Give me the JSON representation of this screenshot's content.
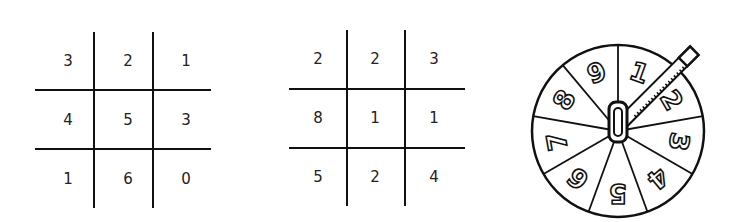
{
  "grids": [
    {
      "cells": [
        [
          "3",
          "2",
          "1"
        ],
        [
          "4",
          "5",
          "3"
        ],
        [
          "1",
          "6",
          "0"
        ]
      ]
    },
    {
      "cells": [
        [
          "2",
          "2",
          "3"
        ],
        [
          "8",
          "1",
          "1"
        ],
        [
          "5",
          "2",
          "4"
        ]
      ]
    }
  ],
  "spinner": {
    "sections": [
      "1",
      "2",
      "3",
      "4",
      "5",
      "6",
      "7",
      "8",
      "9"
    ],
    "pointer": "pencil-and-paperclip"
  }
}
